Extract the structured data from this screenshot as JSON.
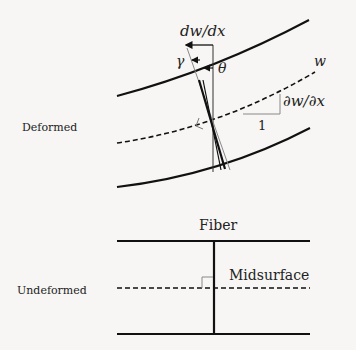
{
  "labels": {
    "deformed": "Deformed",
    "undeformed": "Undeformed",
    "fiber": "Fiber",
    "midsurface": "Midsurface",
    "dw_dx": "dw/dx",
    "gamma": "γ",
    "theta": "θ",
    "w": "w",
    "partial_w_x": "∂w/∂x",
    "one": "1"
  },
  "colors": {
    "line": "#111111",
    "thin_line": "#777777",
    "background": "#f7f6f4"
  }
}
